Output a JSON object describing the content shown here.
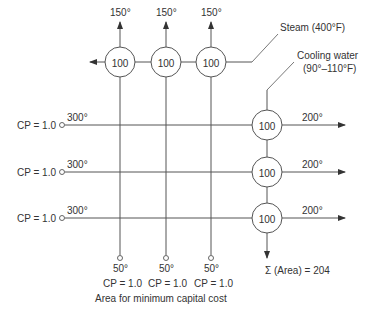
{
  "diagram": {
    "caption": "Area for minimum capital cost",
    "total_area_label": "Σ (Area) = 204",
    "utilities": {
      "steam_label": "Steam (400°F)",
      "cooling_water_label_1": "Cooling water",
      "cooling_water_label_2": "(90°–110°F)"
    },
    "hot_streams": [
      {
        "cp_label": "CP = 1.0",
        "inlet_temp": "300°",
        "outlet_temp": "200°"
      },
      {
        "cp_label": "CP = 1.0",
        "inlet_temp": "300°",
        "outlet_temp": "200°"
      },
      {
        "cp_label": "CP = 1.0",
        "inlet_temp": "300°",
        "outlet_temp": "200°"
      }
    ],
    "cold_streams": [
      {
        "cp_label": "CP = 1.0",
        "inlet_temp": "50°",
        "outlet_temp": "150°"
      },
      {
        "cp_label": "CP = 1.0",
        "inlet_temp": "50°",
        "outlet_temp": "150°"
      },
      {
        "cp_label": "CP = 1.0",
        "inlet_temp": "50°",
        "outlet_temp": "150°"
      }
    ],
    "heaters": [
      {
        "area": "100"
      },
      {
        "area": "100"
      },
      {
        "area": "100"
      }
    ],
    "coolers": [
      {
        "area": "100"
      },
      {
        "area": "100"
      },
      {
        "area": "100"
      }
    ],
    "colors": {
      "line": "#555555",
      "text": "#333333",
      "background": "#ffffff"
    }
  }
}
